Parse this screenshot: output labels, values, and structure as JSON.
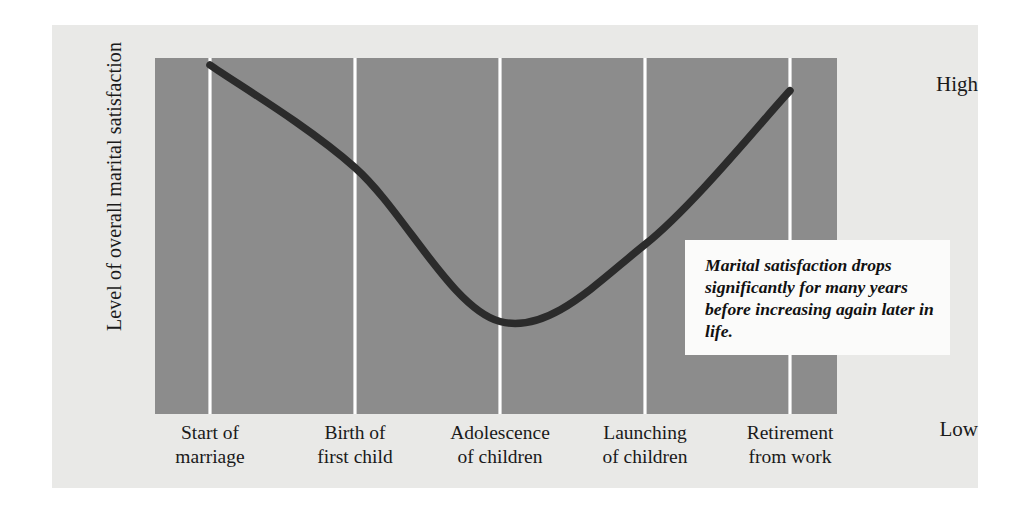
{
  "figure": {
    "background_color": "#e9e9e7",
    "plot_background_color": "#8c8c8c",
    "gridline_color": "#ffffff",
    "curve_color": "#2b2b2b",
    "annotation_background_color": "#fbfbfa"
  },
  "axes": {
    "y_title": "Level of overall marital satisfaction",
    "y_tick_high": "High",
    "y_tick_low": "Low"
  },
  "annotation": {
    "text": "Marital satisfaction drops significantly for many years before increasing again later in life."
  },
  "chart_data": {
    "type": "line",
    "title": "",
    "xlabel": "",
    "ylabel": "Level of overall marital satisfaction",
    "categories": [
      "Start of marriage",
      "Birth of first child",
      "Adolescence of children",
      "Launching of children",
      "Retirement from work"
    ],
    "category_lines": [
      [
        "Start of",
        "marriage"
      ],
      [
        "Birth of",
        "first child"
      ],
      [
        "Adolescence",
        "of children"
      ],
      [
        "Launching",
        "of children"
      ],
      [
        "Retirement",
        "from work"
      ]
    ],
    "series": [
      {
        "name": "Overall marital satisfaction",
        "values": [
          1.0,
          0.7,
          0.25,
          0.475,
          0.925
        ]
      }
    ],
    "ytick_labels": [
      "Low",
      "High"
    ],
    "ytick_values": [
      0,
      1
    ],
    "ylim": [
      0,
      1
    ],
    "grid": true,
    "grid_orientation": "vertical",
    "legend": "none",
    "annotations": [
      "Marital satisfaction drops significantly for many years before increasing again later in life."
    ]
  }
}
